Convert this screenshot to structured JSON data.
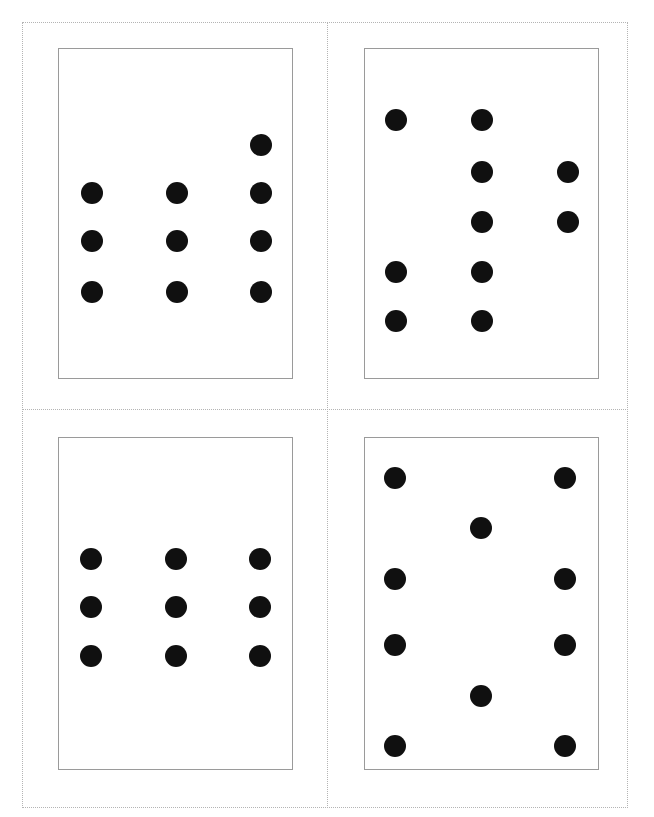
{
  "page": {
    "width": 654,
    "height": 817,
    "background_color": "#ffffff"
  },
  "cut_guides": {
    "color": "#b4b4b4",
    "style": "dotted",
    "frame": {
      "left": 22,
      "top": 22,
      "width": 606,
      "height": 786
    },
    "vertical_divider_x": 327,
    "horizontal_divider_y": 409
  },
  "card_style": {
    "border_color": "#9a9a9a",
    "fill_color": "#ffffff",
    "pip_color": "#101010",
    "pip_diameter": 22
  },
  "cards": [
    {
      "id": "card-top-left",
      "label": "Top left card",
      "position": {
        "left": 58,
        "top": 48,
        "width": 235,
        "height": 331
      },
      "pip_count": 10,
      "arrangement": "three columns; left and middle columns hold three pips, right column holds four pips with one extra raised above",
      "pips": [
        {
          "cx": 260,
          "cy": 144
        },
        {
          "cx": 91,
          "cy": 192
        },
        {
          "cx": 176,
          "cy": 192
        },
        {
          "cx": 260,
          "cy": 192
        },
        {
          "cx": 91,
          "cy": 240
        },
        {
          "cx": 176,
          "cy": 240
        },
        {
          "cx": 260,
          "cy": 240
        },
        {
          "cx": 91,
          "cy": 291
        },
        {
          "cx": 176,
          "cy": 291
        },
        {
          "cx": 260,
          "cy": 291
        }
      ]
    },
    {
      "id": "card-top-right",
      "label": "Top right card",
      "position": {
        "left": 364,
        "top": 48,
        "width": 235,
        "height": 331
      },
      "pip_count": 9,
      "arrangement": "staggered; middle column holds five pips, left column two pips low, right column two pips high",
      "pips": [
        {
          "cx": 395,
          "cy": 119
        },
        {
          "cx": 481,
          "cy": 119
        },
        {
          "cx": 481,
          "cy": 171
        },
        {
          "cx": 567,
          "cy": 171
        },
        {
          "cx": 481,
          "cy": 221
        },
        {
          "cx": 567,
          "cy": 221
        },
        {
          "cx": 395,
          "cy": 271
        },
        {
          "cx": 481,
          "cy": 271
        },
        {
          "cx": 395,
          "cy": 320
        },
        {
          "cx": 481,
          "cy": 320
        }
      ]
    },
    {
      "id": "card-bottom-left",
      "label": "Bottom left card",
      "position": {
        "left": 58,
        "top": 437,
        "width": 235,
        "height": 333
      },
      "pip_count": 9,
      "arrangement": "even three by three grid",
      "pips": [
        {
          "cx": 90,
          "cy": 558
        },
        {
          "cx": 175,
          "cy": 558
        },
        {
          "cx": 259,
          "cy": 558
        },
        {
          "cx": 90,
          "cy": 606
        },
        {
          "cx": 175,
          "cy": 606
        },
        {
          "cx": 259,
          "cy": 606
        },
        {
          "cx": 90,
          "cy": 655
        },
        {
          "cx": 175,
          "cy": 655
        },
        {
          "cx": 259,
          "cy": 655
        }
      ]
    },
    {
      "id": "card-bottom-right",
      "label": "Bottom right card",
      "position": {
        "left": 364,
        "top": 437,
        "width": 235,
        "height": 333
      },
      "pip_count": 10,
      "arrangement": "four pips down each outer column with two single pips on the centre line",
      "pips": [
        {
          "cx": 394,
          "cy": 477
        },
        {
          "cx": 564,
          "cy": 477
        },
        {
          "cx": 480,
          "cy": 527
        },
        {
          "cx": 394,
          "cy": 578
        },
        {
          "cx": 564,
          "cy": 578
        },
        {
          "cx": 394,
          "cy": 644
        },
        {
          "cx": 564,
          "cy": 644
        },
        {
          "cx": 480,
          "cy": 695
        },
        {
          "cx": 394,
          "cy": 745
        },
        {
          "cx": 564,
          "cy": 745
        }
      ]
    }
  ]
}
